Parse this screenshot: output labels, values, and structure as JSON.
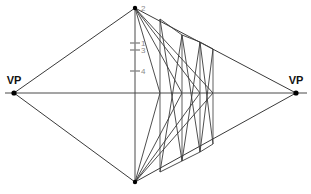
{
  "diagram": {
    "canvas": {
      "width": 311,
      "height": 194
    },
    "colors": {
      "background": "#ffffff",
      "construction_line": "#4a4a4a",
      "ray_line": "#3a3a3a",
      "vertical_guide": "#7a7a7a",
      "tick": "#8a8a8a",
      "label": "#111111",
      "tick_label": "#8a8a8a",
      "vertex_dot": "#000000"
    },
    "horizon": {
      "y": 93,
      "x1": 5,
      "x2": 307
    },
    "vanishing_points": [
      {
        "id": "vp-left",
        "label": "VP",
        "x": 14,
        "y": 93,
        "label_x": 14,
        "label_y": 84
      },
      {
        "id": "vp-right",
        "label": "VP",
        "x": 296,
        "y": 93,
        "label_x": 296,
        "label_y": 84
      }
    ],
    "vertical_measuring_line": {
      "x": 135,
      "y_top": 8,
      "y_bottom": 182
    },
    "vertices": [
      {
        "id": "apex-top",
        "x": 135,
        "y": 8
      },
      {
        "id": "apex-bottom",
        "x": 135,
        "y": 182
      }
    ],
    "measure_ticks": [
      {
        "label": "2",
        "y": 8,
        "tick_half": 0,
        "label_x": 141,
        "label_y": 11
      },
      {
        "label": "1",
        "y": 43,
        "tick_half": 5,
        "label_x": 141,
        "label_y": 46
      },
      {
        "label": "3",
        "y": 50,
        "tick_half": 5,
        "label_x": 141,
        "label_y": 53
      },
      {
        "label": "4",
        "y": 71,
        "tick_half": 5,
        "label_x": 141,
        "label_y": 74
      }
    ],
    "vertical_guides": [
      {
        "id": "guide-a",
        "x": 160,
        "y_top": 19,
        "y_bottom": 172
      },
      {
        "id": "guide-b",
        "x": 182,
        "y_top": 35,
        "y_bottom": 161
      },
      {
        "id": "guide-c",
        "x": 200,
        "y_top": 42,
        "y_bottom": 152
      },
      {
        "id": "guide-d",
        "x": 213,
        "y_top": 49,
        "y_bottom": 144
      }
    ],
    "perspective_rays": [
      {
        "id": "ray-topleft-vpl",
        "x1": 14,
        "y1": 93,
        "x2": 135,
        "y2": 8
      },
      {
        "id": "ray-topright-vpr",
        "x1": 135,
        "y1": 8,
        "x2": 296,
        "y2": 93
      },
      {
        "id": "ray-botleft-vpl",
        "x1": 14,
        "y1": 93,
        "x2": 135,
        "y2": 182
      },
      {
        "id": "ray-botright-vpr",
        "x1": 135,
        "y1": 182,
        "x2": 296,
        "y2": 93
      }
    ],
    "measure_rays": [
      {
        "id": "mray-top-1",
        "x1": 135,
        "y1": 8,
        "x2": 160,
        "y2": 93
      },
      {
        "id": "mray-top-2",
        "x1": 135,
        "y1": 8,
        "x2": 182,
        "y2": 93
      },
      {
        "id": "mray-top-3",
        "x1": 135,
        "y1": 8,
        "x2": 200,
        "y2": 93
      },
      {
        "id": "mray-top-4",
        "x1": 135,
        "y1": 8,
        "x2": 213,
        "y2": 93
      },
      {
        "id": "mray-bot-1",
        "x1": 135,
        "y1": 182,
        "x2": 160,
        "y2": 93
      },
      {
        "id": "mray-bot-2",
        "x1": 135,
        "y1": 182,
        "x2": 182,
        "y2": 93
      },
      {
        "id": "mray-bot-3",
        "x1": 135,
        "y1": 182,
        "x2": 200,
        "y2": 93
      },
      {
        "id": "mray-bot-4",
        "x1": 135,
        "y1": 182,
        "x2": 213,
        "y2": 93
      }
    ],
    "diagonal_braces": [
      {
        "id": "brace-1",
        "x1": 160,
        "y1": 172,
        "x2": 182,
        "y2": 35
      },
      {
        "id": "brace-2",
        "x1": 160,
        "y1": 19,
        "x2": 182,
        "y2": 161
      },
      {
        "id": "brace-3",
        "x1": 182,
        "y1": 161,
        "x2": 200,
        "y2": 42
      },
      {
        "id": "brace-4",
        "x1": 182,
        "y1": 35,
        "x2": 200,
        "y2": 152
      },
      {
        "id": "brace-5",
        "x1": 200,
        "y1": 152,
        "x2": 213,
        "y2": 49
      },
      {
        "id": "brace-6",
        "x1": 200,
        "y1": 42,
        "x2": 213,
        "y2": 144
      }
    ],
    "connector_edges": [
      {
        "id": "edge-top-a-b",
        "x1": 160,
        "y1": 19,
        "x2": 182,
        "y2": 35
      },
      {
        "id": "edge-top-b-c",
        "x1": 182,
        "y1": 35,
        "x2": 200,
        "y2": 42
      },
      {
        "id": "edge-top-c-d",
        "x1": 200,
        "y1": 42,
        "x2": 213,
        "y2": 49
      },
      {
        "id": "edge-bot-a-b",
        "x1": 160,
        "y1": 172,
        "x2": 182,
        "y2": 161
      },
      {
        "id": "edge-bot-b-c",
        "x1": 182,
        "y1": 161,
        "x2": 200,
        "y2": 152
      },
      {
        "id": "edge-bot-c-d",
        "x1": 200,
        "y1": 152,
        "x2": 213,
        "y2": 144
      }
    ]
  }
}
